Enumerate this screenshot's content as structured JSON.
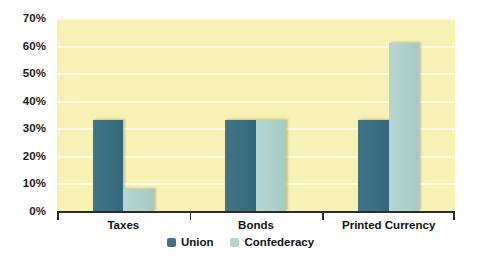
{
  "chart_data": {
    "type": "bar",
    "title": "",
    "subtitle": "",
    "xlabel": "",
    "ylabel": "",
    "categories": [
      "Taxes",
      "Bonds",
      "Printed Currency"
    ],
    "series": [
      {
        "name": "Union",
        "color": "#3f7487",
        "values": [
          33,
          33,
          33
        ]
      },
      {
        "name": "Confederacy",
        "color": "#b6d5d0",
        "values": [
          8,
          33,
          61
        ]
      }
    ],
    "ylim": [
      0,
      70
    ],
    "ytick_values": [
      0,
      10,
      20,
      30,
      40,
      50,
      60,
      70
    ],
    "ytick_labels": [
      "0%",
      "10%",
      "20%",
      "30%",
      "40%",
      "50%",
      "60%",
      "70%"
    ],
    "grid": true,
    "grid_axis": "y",
    "legend_position": "bottom-center",
    "plot_background": "#f7f2b4",
    "figure_background": "#ffffff",
    "axis_color": "#2b2b2b",
    "gridline_color": "#ffffff"
  },
  "legend": {
    "items": [
      {
        "label": "Union"
      },
      {
        "label": "Confederacy"
      }
    ]
  }
}
